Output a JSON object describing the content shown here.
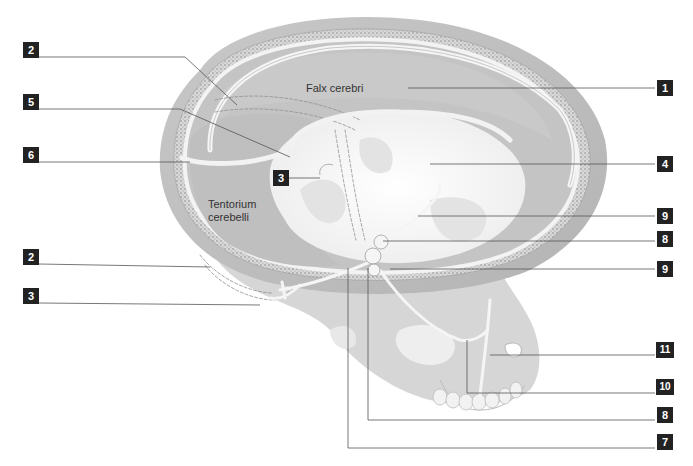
{
  "diagram": {
    "region_labels": {
      "falx": "Falx cerebri",
      "tentorium_line1": "Tentorium",
      "tentorium_line2": "cerebelli"
    },
    "callouts": [
      {
        "id": "left-2-top",
        "number": "2",
        "side": "left",
        "y": 50
      },
      {
        "id": "left-5",
        "number": "5",
        "side": "left",
        "y": 102
      },
      {
        "id": "left-6",
        "number": "6",
        "side": "left",
        "y": 155
      },
      {
        "id": "center-3",
        "number": "3",
        "side": "center",
        "y": 177
      },
      {
        "id": "left-2-bottom",
        "number": "2",
        "side": "left",
        "y": 257
      },
      {
        "id": "left-3-bottom",
        "number": "3",
        "side": "left",
        "y": 296
      },
      {
        "id": "right-1",
        "number": "1",
        "side": "right",
        "y": 80
      },
      {
        "id": "right-4",
        "number": "4",
        "side": "right",
        "y": 157
      },
      {
        "id": "right-9-top",
        "number": "9",
        "side": "right",
        "y": 210
      },
      {
        "id": "right-8-top",
        "number": "8",
        "side": "right",
        "y": 233
      },
      {
        "id": "right-9-bottom",
        "number": "9",
        "side": "right",
        "y": 265
      },
      {
        "id": "right-11",
        "number": "11",
        "side": "right",
        "y": 350
      },
      {
        "id": "right-10",
        "number": "10",
        "side": "right",
        "y": 387
      },
      {
        "id": "right-8-bottom",
        "number": "8",
        "side": "right",
        "y": 413
      },
      {
        "id": "right-7",
        "number": "7",
        "side": "right",
        "y": 440
      }
    ],
    "colors": {
      "label_bg": "#222222",
      "label_text": "#ffffff",
      "leader_line": "#555555",
      "bone": "#cfcfcf",
      "dura": "#bdbdbd",
      "sinus": "#efefef"
    }
  }
}
